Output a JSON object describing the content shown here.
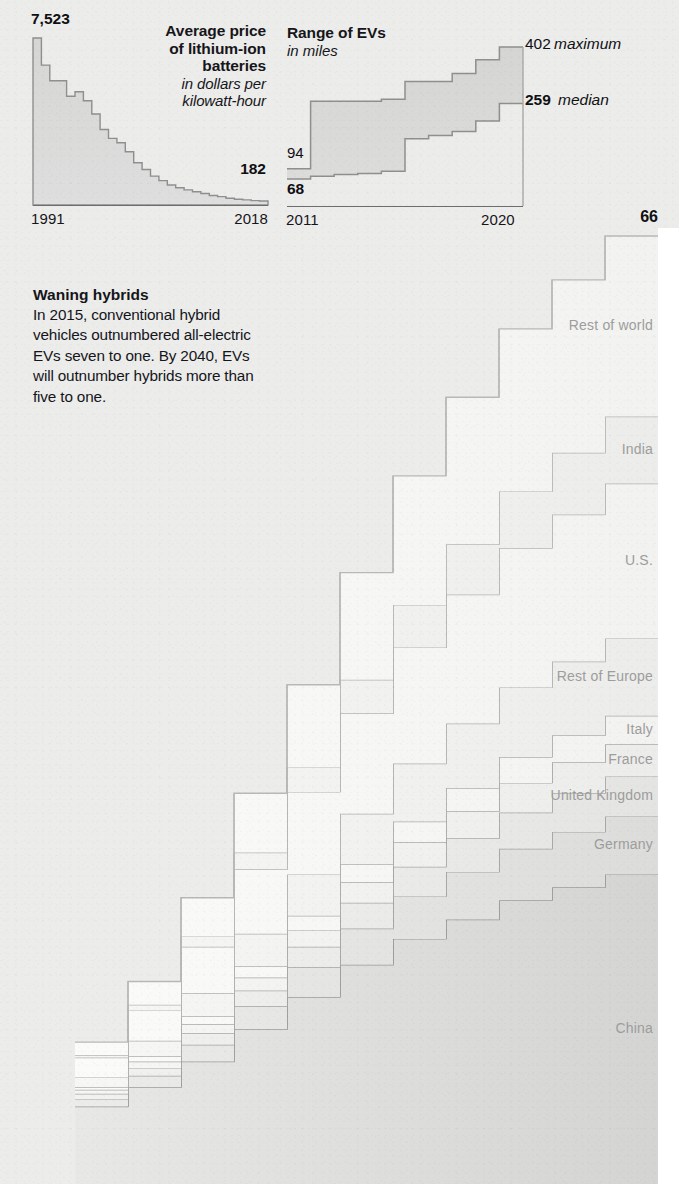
{
  "page": {
    "background": "#ececeb",
    "ink": "#16161a"
  },
  "panels": {
    "battery": {
      "title_line1": "Average price",
      "title_line2": "of lithium-ion",
      "title_line3": "batteries",
      "sub_line1": "in dollars per",
      "sub_line2": "kilowatt-hour",
      "start_value": "7,523",
      "end_value": "182",
      "x_start": "1991",
      "x_end": "2018"
    },
    "range": {
      "title": "Range of EVs",
      "sub": "in miles",
      "max_value": "402",
      "max_label": "maximum",
      "median_value": "259",
      "median_label": "median",
      "low_value_top": "94",
      "low_value_bottom": "68",
      "x_start": "2011",
      "x_end": "2020"
    }
  },
  "callout": {
    "title": "Waning hybrids",
    "body": "In 2015, conventional hybrid vehicles outnumbered all-electric EVs seven to one. By 2040, EVs will outnumber hybrids more than five to one."
  },
  "stack": {
    "top_value": "66",
    "top_unit": "EVs",
    "labels": [
      "Rest of world",
      "India",
      "U.S.",
      "Rest of Europe",
      "Italy",
      "France",
      "United Kingdom",
      "Germany",
      "China"
    ]
  },
  "chart_data": [
    {
      "type": "area",
      "name": "battery-price",
      "title": "Average price of lithium-ion batteries",
      "subtitle": "in dollars per kilowatt-hour",
      "ylabel": "dollars per kilowatt-hour",
      "xlabel": "",
      "grid": false,
      "legend": "none",
      "x": [
        1991,
        1992,
        1993,
        1994,
        1995,
        1996,
        1997,
        1998,
        1999,
        2000,
        2001,
        2002,
        2003,
        2004,
        2005,
        2006,
        2007,
        2008,
        2009,
        2010,
        2011,
        2012,
        2013,
        2014,
        2015,
        2016,
        2017,
        2018
      ],
      "values": [
        7523,
        6300,
        5600,
        5600,
        4900,
        5100,
        4700,
        4100,
        3400,
        3000,
        2800,
        2400,
        1900,
        1600,
        1300,
        1100,
        900,
        780,
        680,
        600,
        520,
        430,
        380,
        300,
        260,
        230,
        200,
        182
      ],
      "xlim": [
        1991,
        2018
      ],
      "ylim": [
        0,
        7523
      ],
      "annotations": [
        {
          "text": "7,523",
          "at": "1991"
        },
        {
          "text": "182",
          "at": "2018"
        }
      ],
      "tick_labels": [
        "1991",
        "2018"
      ]
    },
    {
      "type": "area",
      "name": "ev-range",
      "title": "Range of EVs",
      "subtitle": "in miles",
      "ylabel": "miles",
      "xlabel": "",
      "grid": false,
      "legend": "none",
      "x": [
        2011,
        2012,
        2013,
        2014,
        2015,
        2016,
        2017,
        2018,
        2019,
        2020
      ],
      "series": [
        {
          "name": "maximum",
          "values": [
            94,
            265,
            265,
            265,
            270,
            315,
            315,
            335,
            370,
            402
          ]
        },
        {
          "name": "median",
          "values": [
            68,
            75,
            80,
            82,
            88,
            170,
            178,
            188,
            215,
            259
          ]
        }
      ],
      "xlim": [
        2011,
        2020
      ],
      "ylim": [
        0,
        402
      ],
      "annotations": [
        {
          "text": "402 maximum",
          "at": "2020"
        },
        {
          "text": "259 median",
          "at": "2020"
        },
        {
          "text": "94",
          "at": "2011"
        },
        {
          "text": "68",
          "at": "2011"
        }
      ],
      "tick_labels": [
        "2011",
        "2020"
      ]
    },
    {
      "type": "area",
      "name": "ev-fleet-stacked-step",
      "title": "Electric vehicles on the road by market",
      "stacked": true,
      "step": true,
      "grid": false,
      "legend": "inline-right",
      "top_annotation": "66 EVs",
      "categories": [
        "China",
        "Germany",
        "United Kingdom",
        "France",
        "Italy",
        "Rest of Europe",
        "U.S.",
        "India",
        "Rest of world"
      ],
      "x": [
        2020,
        2022,
        2024,
        2026,
        2028,
        2030,
        2032,
        2034,
        2036,
        2038,
        2040
      ],
      "series": [
        {
          "name": "China",
          "values": [
            6.0,
            7.5,
            9.5,
            12.0,
            14.5,
            17.0,
            19.0,
            20.5,
            22.0,
            23.0,
            24.0
          ]
        },
        {
          "name": "Germany",
          "values": [
            0.6,
            0.9,
            1.3,
            1.8,
            2.3,
            2.8,
            3.3,
            3.7,
            4.0,
            4.3,
            4.5
          ]
        },
        {
          "name": "United Kingdom",
          "values": [
            0.4,
            0.6,
            0.9,
            1.2,
            1.6,
            2.0,
            2.3,
            2.6,
            2.8,
            3.0,
            3.1
          ]
        },
        {
          "name": "France",
          "values": [
            0.3,
            0.5,
            0.7,
            1.0,
            1.3,
            1.6,
            1.9,
            2.1,
            2.3,
            2.4,
            2.5
          ]
        },
        {
          "name": "Italy",
          "values": [
            0.2,
            0.4,
            0.6,
            0.9,
            1.1,
            1.4,
            1.6,
            1.8,
            2.0,
            2.1,
            2.2
          ]
        },
        {
          "name": "Rest of Europe",
          "values": [
            0.8,
            1.2,
            1.8,
            2.5,
            3.2,
            3.9,
            4.5,
            5.0,
            5.4,
            5.7,
            6.0
          ]
        },
        {
          "name": "U.S.",
          "values": [
            1.5,
            2.4,
            3.6,
            5.0,
            6.4,
            7.8,
            9.0,
            10.0,
            10.8,
            11.4,
            12.0
          ]
        },
        {
          "name": "India",
          "values": [
            0.2,
            0.4,
            0.8,
            1.3,
            1.9,
            2.6,
            3.3,
            3.9,
            4.4,
            4.8,
            5.2
          ]
        },
        {
          "name": "Rest of world",
          "values": [
            1.0,
            1.8,
            3.0,
            4.6,
            6.4,
            8.3,
            10.0,
            11.4,
            12.6,
            13.4,
            14.0
          ]
        }
      ],
      "total_label": "66",
      "total_unit": "EVs"
    }
  ]
}
